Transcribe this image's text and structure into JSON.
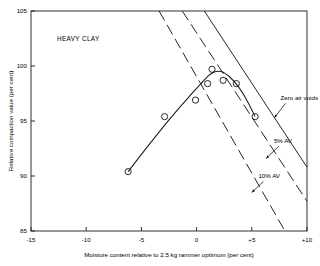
{
  "figure": {
    "panel_label": "HEAVY CLAY",
    "background_color": "#ffffff",
    "line_color": "#1a1a1a"
  },
  "axes": {
    "x": {
      "title": "Moisture content relative to 2.5 kg rammer optimum (per cent)",
      "min": -15,
      "max": 10,
      "ticks": [
        -15,
        -10,
        -5,
        0,
        5,
        10
      ],
      "tick_labels": [
        "-15",
        "-10",
        "-5",
        "0",
        "+5",
        "+10"
      ]
    },
    "y": {
      "title": "Relative compaction value (per cent)",
      "min": 85,
      "max": 105,
      "ticks": [
        85,
        90,
        95,
        100,
        105
      ],
      "tick_labels": [
        "85",
        "90",
        "95",
        "100",
        "105"
      ]
    }
  },
  "annotations": [
    {
      "id": "zero-air-voids",
      "label": "Zero air voids",
      "x": 7.6,
      "y": 96.9,
      "arrow_to_x": 7.05,
      "arrow_to_y": 95.3
    },
    {
      "id": "five-percent-av",
      "label": "5% AV",
      "x": 7.0,
      "y": 93.0,
      "arrow_to_x": 6.3,
      "arrow_to_y": 91.6
    },
    {
      "id": "ten-percent-av",
      "label": "10% AV",
      "x": 5.6,
      "y": 89.8,
      "arrow_to_x": 5.0,
      "arrow_to_y": 88.5
    }
  ],
  "chart_data": {
    "type": "scatter",
    "title": "HEAVY CLAY",
    "xlabel": "Moisture content relative to 2.5 kg rammer optimum (per cent)",
    "ylabel": "Relative compaction value (per cent)",
    "xlim": [
      -15,
      10
    ],
    "ylim": [
      85,
      105
    ],
    "grid": false,
    "legend": "none",
    "series": [
      {
        "name": "Measured compaction points",
        "marker": "open-circle",
        "type": "scatter",
        "points": [
          {
            "x": -6.2,
            "y": 90.4
          },
          {
            "x": -2.9,
            "y": 95.4
          },
          {
            "x": -0.1,
            "y": 96.9
          },
          {
            "x": 1.0,
            "y": 98.4
          },
          {
            "x": 1.4,
            "y": 99.7
          },
          {
            "x": 2.4,
            "y": 98.7
          },
          {
            "x": 3.6,
            "y": 98.4
          },
          {
            "x": 5.3,
            "y": 95.4
          }
        ]
      },
      {
        "name": "Fitted compaction curve",
        "type": "line",
        "style": "solid",
        "points": [
          {
            "x": -6.2,
            "y": 90.4
          },
          {
            "x": -4.5,
            "y": 92.6
          },
          {
            "x": -2.5,
            "y": 95.1
          },
          {
            "x": -0.6,
            "y": 97.3
          },
          {
            "x": 0.4,
            "y": 98.4
          },
          {
            "x": 1.3,
            "y": 99.3
          },
          {
            "x": 2.2,
            "y": 99.5
          },
          {
            "x": 3.0,
            "y": 99.0
          },
          {
            "x": 3.8,
            "y": 98.1
          },
          {
            "x": 4.6,
            "y": 96.8
          },
          {
            "x": 5.3,
            "y": 95.4
          }
        ]
      },
      {
        "name": "Zero air voids",
        "type": "line",
        "style": "solid",
        "points": [
          {
            "x": 0.7,
            "y": 105.0
          },
          {
            "x": 10.0,
            "y": 90.8
          }
        ]
      },
      {
        "name": "5% AV",
        "type": "line",
        "style": "dashed",
        "points": [
          {
            "x": -1.3,
            "y": 105.0
          },
          {
            "x": 10.0,
            "y": 87.7
          }
        ]
      },
      {
        "name": "10% AV",
        "type": "line",
        "style": "dashed",
        "points": [
          {
            "x": -3.4,
            "y": 105.0
          },
          {
            "x": 8.0,
            "y": 85.0
          }
        ]
      }
    ]
  }
}
